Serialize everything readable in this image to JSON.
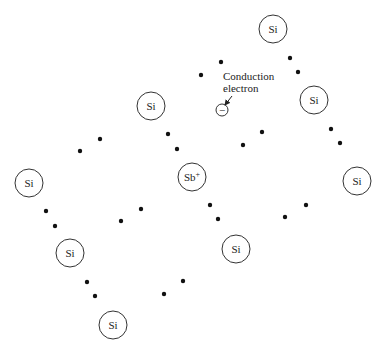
{
  "diagram": {
    "atoms": [
      {
        "id": "si-top-right",
        "label": "Si",
        "x": 273,
        "y": 29
      },
      {
        "id": "si-right-mid",
        "label": "Si",
        "x": 314,
        "y": 100
      },
      {
        "id": "si-far-right",
        "label": "Si",
        "x": 357,
        "y": 181
      },
      {
        "id": "si-center-top",
        "label": "Si",
        "x": 151,
        "y": 106
      },
      {
        "id": "sb-center",
        "label": "Sb",
        "superscript": "+",
        "x": 192,
        "y": 177
      },
      {
        "id": "si-left",
        "label": "Si",
        "x": 29,
        "y": 183
      },
      {
        "id": "si-left-lower",
        "label": "Si",
        "x": 70,
        "y": 253
      },
      {
        "id": "si-bottom",
        "label": "Si",
        "x": 113,
        "y": 325
      },
      {
        "id": "si-right-lower",
        "label": "Si",
        "x": 236,
        "y": 249
      }
    ],
    "atom_radius": 14,
    "bond_electrons": [
      {
        "x": 100,
        "y": 139
      },
      {
        "x": 80,
        "y": 151
      },
      {
        "x": 168,
        "y": 134
      },
      {
        "x": 177,
        "y": 149
      },
      {
        "x": 221,
        "y": 62
      },
      {
        "x": 201,
        "y": 75
      },
      {
        "x": 290,
        "y": 58
      },
      {
        "x": 298,
        "y": 72
      },
      {
        "x": 262,
        "y": 132
      },
      {
        "x": 243,
        "y": 145
      },
      {
        "x": 331,
        "y": 129
      },
      {
        "x": 340,
        "y": 143
      },
      {
        "x": 46,
        "y": 211
      },
      {
        "x": 55,
        "y": 226
      },
      {
        "x": 141,
        "y": 209
      },
      {
        "x": 121,
        "y": 221
      },
      {
        "x": 87,
        "y": 282
      },
      {
        "x": 95,
        "y": 296
      },
      {
        "x": 183,
        "y": 281
      },
      {
        "x": 164,
        "y": 294
      },
      {
        "x": 210,
        "y": 205
      },
      {
        "x": 218,
        "y": 219
      },
      {
        "x": 306,
        "y": 205
      },
      {
        "x": 285,
        "y": 217
      }
    ],
    "conduction_electron": {
      "symbol": "−",
      "x": 222,
      "y": 110,
      "radius": 6
    },
    "annotation": {
      "line1": "Conduction",
      "line2": "electron",
      "x": 223,
      "y1": 80,
      "y2": 92,
      "arrow": {
        "x1": 232,
        "y1": 96,
        "x2": 225,
        "y2": 105
      }
    }
  }
}
